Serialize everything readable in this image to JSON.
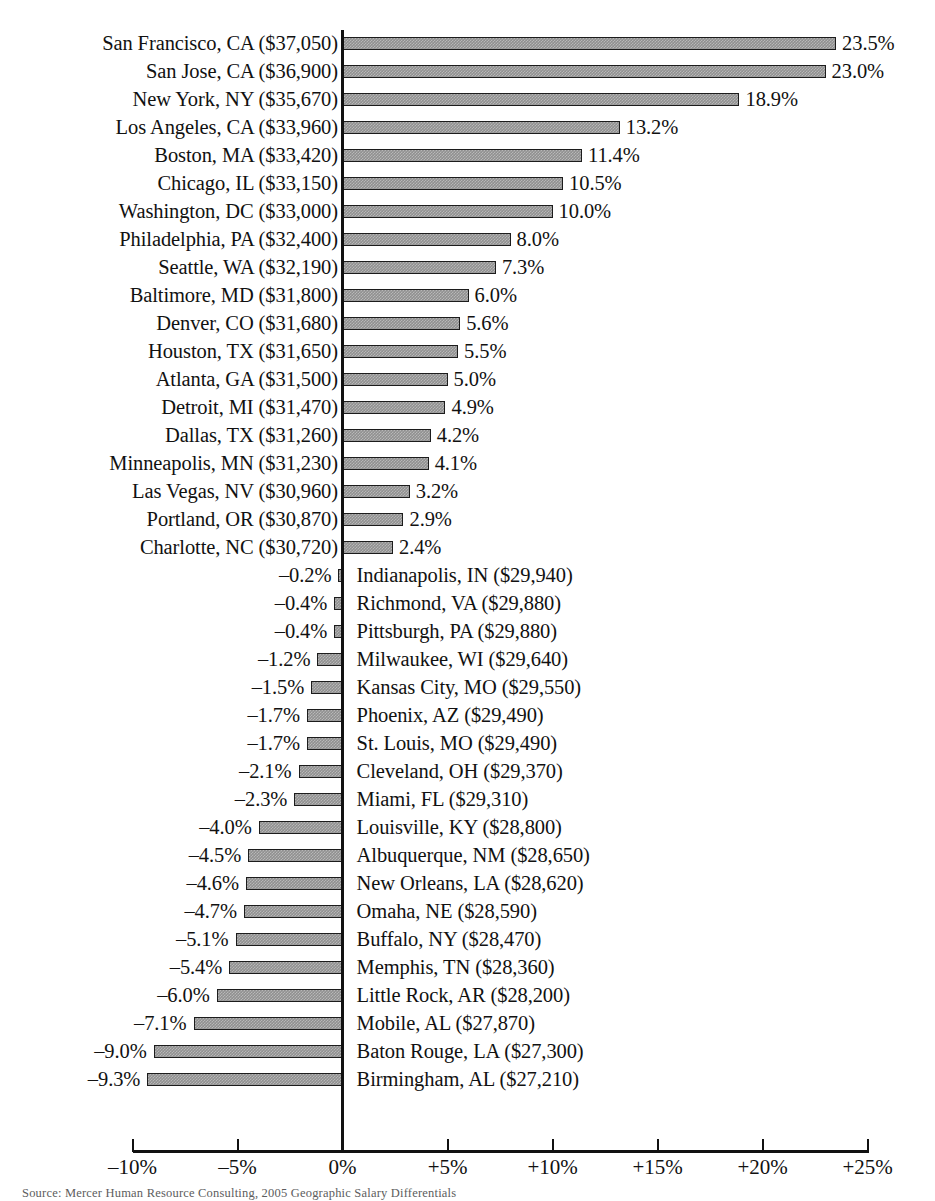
{
  "chart_data": {
    "type": "bar",
    "orientation": "horizontal",
    "title": "",
    "xlabel": "",
    "ylabel": "",
    "xlim": [
      -10,
      25
    ],
    "grid": false,
    "legend": null,
    "source_note": "Source: Mercer Human Resource Consulting, 2005 Geographic Salary Differentials",
    "axis_tick_labels": [
      "–10%",
      "–5%",
      "0%",
      "+5%",
      "+10%",
      "+15%",
      "+20%",
      "+25%"
    ],
    "axis_tick_values": [
      -10,
      -5,
      0,
      5,
      10,
      15,
      20,
      25
    ],
    "categories": [
      "San Francisco, CA ($37,050)",
      "San Jose, CA ($36,900)",
      "New York, NY ($35,670)",
      "Los Angeles, CA ($33,960)",
      "Boston, MA ($33,420)",
      "Chicago, IL ($33,150)",
      "Washington, DC ($33,000)",
      "Philadelphia, PA ($32,400)",
      "Seattle, WA ($32,190)",
      "Baltimore, MD ($31,800)",
      "Denver, CO ($31,680)",
      "Houston, TX ($31,650)",
      "Atlanta, GA ($31,500)",
      "Detroit, MI ($31,470)",
      "Dallas, TX ($31,260)",
      "Minneapolis, MN ($31,230)",
      "Las Vegas, NV ($30,960)",
      "Portland, OR ($30,870)",
      "Charlotte, NC ($30,720)",
      "Indianapolis, IN ($29,940)",
      "Richmond, VA ($29,880)",
      "Pittsburgh, PA ($29,880)",
      "Milwaukee, WI ($29,640)",
      "Kansas City, MO ($29,550)",
      "Phoenix, AZ ($29,490)",
      "St. Louis, MO ($29,490)",
      "Cleveland, OH ($29,370)",
      "Miami, FL ($29,310)",
      "Louisville, KY ($28,800)",
      "Albuquerque, NM ($28,650)",
      "New Orleans, LA ($28,620)",
      "Omaha, NE ($28,590)",
      "Buffalo, NY ($28,470)",
      "Memphis, TN ($28,360)",
      "Little Rock, AR ($28,200)",
      "Mobile, AL ($27,870)",
      "Baton Rouge, LA ($27,300)",
      "Birmingham, AL ($27,210)"
    ],
    "values": [
      23.5,
      23.0,
      18.9,
      13.2,
      11.4,
      10.5,
      10.0,
      8.0,
      7.3,
      6.0,
      5.6,
      5.5,
      5.0,
      4.9,
      4.2,
      4.1,
      3.2,
      2.9,
      2.4,
      -0.2,
      -0.4,
      -0.4,
      -1.2,
      -1.5,
      -1.7,
      -1.7,
      -2.1,
      -2.3,
      -4.0,
      -4.5,
      -4.6,
      -4.7,
      -5.1,
      -5.4,
      -6.0,
      -7.1,
      -9.0,
      -9.3
    ],
    "value_labels": [
      "23.5%",
      "23.0%",
      "18.9%",
      "13.2%",
      "11.4%",
      "10.5%",
      "10.0%",
      "8.0%",
      "7.3%",
      "6.0%",
      "5.6%",
      "5.5%",
      "5.0%",
      "4.9%",
      "4.2%",
      "4.1%",
      "3.2%",
      "2.9%",
      "2.4%",
      "–0.2%",
      "–0.4%",
      "–0.4%",
      "–1.2%",
      "–1.5%",
      "–1.7%",
      "–1.7%",
      "–2.1%",
      "–2.3%",
      "–4.0%",
      "–4.5%",
      "–4.6%",
      "–4.7%",
      "–5.1%",
      "–5.4%",
      "–6.0%",
      "–7.1%",
      "–9.0%",
      "–9.3%"
    ],
    "salaries": [
      "$37,050",
      "$36,900",
      "$35,670",
      "$33,960",
      "$33,420",
      "$33,150",
      "$33,000",
      "$32,400",
      "$32,190",
      "$31,800",
      "$31,680",
      "$31,650",
      "$31,500",
      "$31,470",
      "$31,260",
      "$31,230",
      "$30,960",
      "$30,870",
      "$30,720",
      "$29,940",
      "$29,880",
      "$29,880",
      "$29,640",
      "$29,550",
      "$29,490",
      "$29,490",
      "$29,370",
      "$29,310",
      "$28,800",
      "$28,650",
      "$28,620",
      "$28,590",
      "$28,470",
      "$28,360",
      "$28,200",
      "$27,870",
      "$27,300",
      "$27,210"
    ],
    "colors": {
      "bar_fill": "#909090",
      "bar_border": "#1c1c1c",
      "axis": "#111111",
      "text": "#111111",
      "background": "#ffffff"
    }
  }
}
